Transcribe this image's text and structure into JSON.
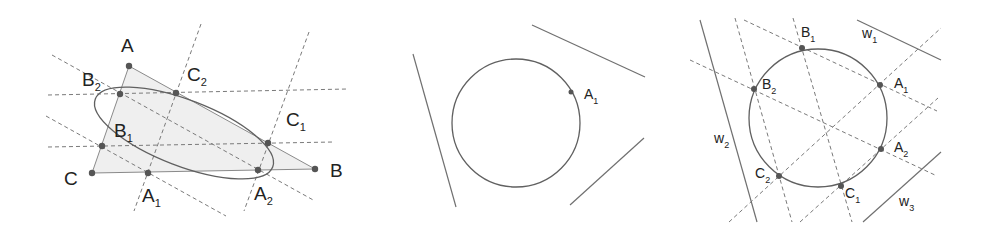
{
  "panels": [
    {
      "id": "triangle-ellipse",
      "triangle": {
        "A": [
          129,
          66
        ],
        "B": [
          315,
          169
        ],
        "C": [
          92,
          173
        ],
        "fill": "#efefef"
      },
      "ellipse": {
        "cx": 184,
        "cy": 133,
        "rx": 95,
        "ry": 33,
        "rotate": 21
      },
      "points": [
        {
          "name": "A",
          "x": 129,
          "y": 66,
          "label": "A",
          "sub": "",
          "lx": 121,
          "ly": 52
        },
        {
          "name": "B",
          "x": 315,
          "y": 169,
          "label": "B",
          "sub": "",
          "lx": 330,
          "ly": 177
        },
        {
          "name": "C",
          "x": 92,
          "y": 173,
          "label": "C",
          "sub": "",
          "lx": 64,
          "ly": 185
        },
        {
          "name": "B2",
          "x": 120,
          "y": 94,
          "label": "B",
          "sub": "2",
          "lx": 82,
          "ly": 86
        },
        {
          "name": "C2",
          "x": 176,
          "y": 93,
          "label": "C",
          "sub": "2",
          "lx": 187,
          "ly": 81
        },
        {
          "name": "C1",
          "x": 268,
          "y": 143,
          "label": "C",
          "sub": "1",
          "lx": 286,
          "ly": 126
        },
        {
          "name": "B1",
          "x": 102,
          "y": 146,
          "label": "B",
          "sub": "1",
          "lx": 114,
          "ly": 137
        },
        {
          "name": "A1",
          "x": 148,
          "y": 173,
          "label": "A",
          "sub": "1",
          "lx": 142,
          "ly": 202
        },
        {
          "name": "A2",
          "x": 258,
          "y": 170,
          "label": "A",
          "sub": "2",
          "lx": 254,
          "ly": 200
        }
      ]
    },
    {
      "id": "circle-three-lines",
      "circle": {
        "cx": 516,
        "cy": 123,
        "r": 64
      },
      "lines": [
        [
          413,
          54,
          456,
          207
        ],
        [
          532,
          25,
          645,
          77
        ],
        [
          570,
          205,
          644,
          138
        ]
      ],
      "points": [
        {
          "name": "A1",
          "x": 571,
          "y": 92,
          "label": "A",
          "sub": "1",
          "lx": 584,
          "ly": 99
        }
      ]
    },
    {
      "id": "circle-w-lines",
      "circle": {
        "cx": 818,
        "cy": 118,
        "r": 69
      },
      "lines": [
        {
          "name": "w1",
          "coords": [
            857,
            20,
            941,
            60
          ],
          "label": "w",
          "sub": "1",
          "lx": 862,
          "ly": 38
        },
        {
          "name": "w2",
          "coords": [
            700,
            20,
            757,
            222
          ],
          "label": "w",
          "sub": "2",
          "lx": 714,
          "ly": 143
        },
        {
          "name": "w3",
          "coords": [
            863,
            222,
            941,
            152
          ],
          "label": "w",
          "sub": "3",
          "lx": 899,
          "ly": 206
        }
      ],
      "points": [
        {
          "name": "B1",
          "x": 802,
          "y": 48,
          "label": "B",
          "sub": "1",
          "lx": 801,
          "ly": 37
        },
        {
          "name": "B2",
          "x": 754,
          "y": 89,
          "label": "B",
          "sub": "2",
          "lx": 762,
          "ly": 89
        },
        {
          "name": "A1",
          "x": 880,
          "y": 85,
          "label": "A",
          "sub": "1",
          "lx": 894,
          "ly": 88
        },
        {
          "name": "A2",
          "x": 881,
          "y": 149,
          "label": "A",
          "sub": "2",
          "lx": 894,
          "ly": 152
        },
        {
          "name": "C2",
          "x": 779,
          "y": 176,
          "label": "C",
          "sub": "2",
          "lx": 755,
          "ly": 178
        },
        {
          "name": "C1",
          "x": 841,
          "y": 186,
          "label": "C",
          "sub": "1",
          "lx": 845,
          "ly": 198
        }
      ]
    }
  ]
}
